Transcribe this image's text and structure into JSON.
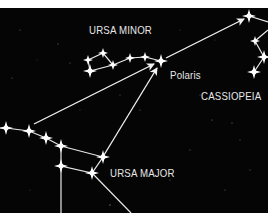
{
  "diagram": {
    "background_color": "#050505",
    "line_color": "#f2f2f2",
    "star_color": "#ffffff",
    "labels": {
      "ursa_minor": "URSA MINOR",
      "polaris": "Polaris",
      "cassiopeia": "CASSIOPEIA",
      "ursa_major": "URSA MAJOR"
    },
    "constellations": [
      {
        "name": "Ursa Minor",
        "stars": [
          [
            88,
            60
          ],
          [
            103,
            53
          ],
          [
            113,
            65
          ],
          [
            90,
            71
          ],
          [
            130,
            58
          ],
          [
            145,
            57
          ],
          [
            161,
            61
          ]
        ]
      },
      {
        "name": "Cassiopeia",
        "stars": [
          [
            249,
            16
          ],
          [
            255,
            41
          ],
          [
            264,
            57
          ],
          [
            254,
            72
          ]
        ]
      },
      {
        "name": "Ursa Major",
        "stars": [
          [
            6,
            128
          ],
          [
            29,
            131
          ],
          [
            46,
            138
          ],
          [
            61,
            146
          ],
          [
            61,
            166
          ],
          [
            103,
            157
          ],
          [
            92,
            173
          ]
        ]
      }
    ],
    "pointer_arrows": [
      {
        "from": "Ursa Major handle",
        "to": "Polaris"
      },
      {
        "from": "Ursa Major bowl",
        "to": "Polaris"
      },
      {
        "from": "Polaris",
        "to": "Cassiopeia"
      }
    ]
  }
}
